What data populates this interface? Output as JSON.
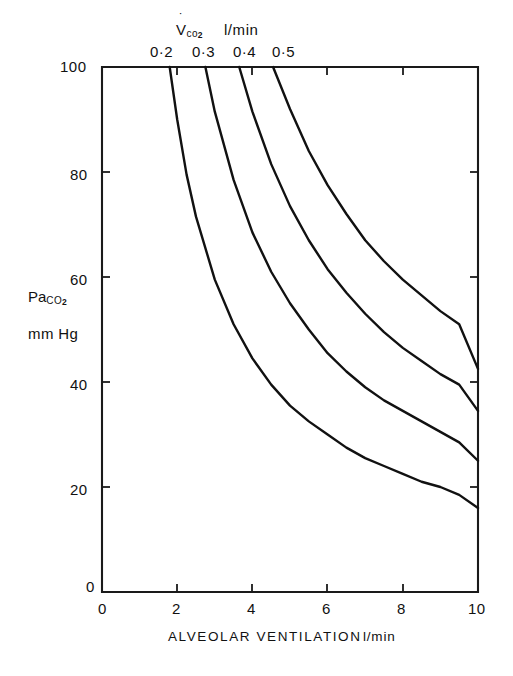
{
  "figure": {
    "background": "#ffffff",
    "line_color": "#111111",
    "axis_color": "#1a1a1a"
  },
  "top_axis": {
    "series_symbol": "V",
    "series_sub": "co",
    "series_sub2": "2",
    "series_units": "l/min",
    "tick_labels": [
      "0·2",
      "0·3",
      "0·4",
      "0·5"
    ]
  },
  "y_axis": {
    "label_line1_main": "Pa",
    "label_line1_sub": "CO",
    "label_line1_sub2": "2",
    "label_line2": "mm Hg",
    "tick_labels": [
      "0",
      "20",
      "40",
      "60",
      "80",
      "100"
    ]
  },
  "x_axis": {
    "title": "ALVEOLAR  VENTILATION",
    "units": "l/min",
    "tick_labels": [
      "0",
      "2",
      "4",
      "6",
      "8",
      "10"
    ]
  },
  "chart_data": {
    "type": "line",
    "title": "",
    "xlabel": "ALVEOLAR VENTILATION l/min",
    "ylabel": "PaCO2 mm Hg",
    "xlim": [
      0,
      10
    ],
    "ylim": [
      0,
      100
    ],
    "grid": false,
    "legend_position": "top-axis-labels",
    "relation": "PaCO2 = K * VCO2 / VA",
    "x_ticks": [
      0,
      2,
      4,
      6,
      8,
      10
    ],
    "y_ticks": [
      0,
      20,
      40,
      60,
      80,
      100
    ],
    "top_axis_label_values": [
      0.2,
      0.3,
      0.4,
      0.5
    ],
    "top_axis_label_positions_x": [
      1.8,
      2.75,
      3.65,
      4.55
    ],
    "series": [
      {
        "name": "VCO2 = 0.2 l/min",
        "K": 172,
        "x_start": 1.8,
        "y_at_x10": 16,
        "x": [
          1.8,
          2.0,
          2.25,
          2.5,
          3.0,
          3.5,
          4.0,
          4.5,
          5.0,
          5.5,
          6.0,
          6.5,
          7.0,
          7.5,
          8.0,
          8.5,
          9.0,
          9.5,
          10.0
        ],
        "values": [
          100,
          90,
          79.5,
          71.5,
          59.5,
          51,
          44.5,
          39.5,
          35.5,
          32.5,
          30,
          27.5,
          25.5,
          24,
          22.5,
          21,
          20,
          18.5,
          16
        ]
      },
      {
        "name": "VCO2 = 0.3 l/min",
        "K": 262,
        "x_start": 2.75,
        "y_at_x10": 25,
        "x": [
          2.75,
          3.0,
          3.5,
          4.0,
          4.5,
          5.0,
          5.5,
          6.0,
          6.5,
          7.0,
          7.5,
          8.0,
          8.5,
          9.0,
          9.5,
          10.0
        ],
        "values": [
          100,
          91.5,
          78.5,
          68.5,
          61,
          55,
          50,
          45.5,
          42,
          39,
          36.5,
          34.5,
          32.5,
          30.5,
          28.5,
          25
        ]
      },
      {
        "name": "VCO2 = 0.4 l/min",
        "K": 352,
        "x_start": 3.65,
        "y_at_x10": 34.5,
        "x": [
          3.65,
          4.0,
          4.5,
          5.0,
          5.5,
          6.0,
          6.5,
          7.0,
          7.5,
          8.0,
          8.5,
          9.0,
          9.5,
          10.0
        ],
        "values": [
          100,
          91.5,
          81.5,
          73.5,
          67,
          61.5,
          57,
          53,
          49.5,
          46.5,
          44,
          41.5,
          39.5,
          34.5
        ]
      },
      {
        "name": "VCO2 = 0.5 l/min",
        "K": 440,
        "x_start": 4.55,
        "y_at_x10": 42.5,
        "x": [
          4.55,
          5.0,
          5.5,
          6.0,
          6.5,
          7.0,
          7.5,
          8.0,
          8.5,
          9.0,
          9.5,
          10.0
        ],
        "values": [
          100,
          92,
          84,
          77.5,
          72,
          67,
          63,
          59.5,
          56.5,
          53.5,
          51,
          42.5
        ]
      }
    ]
  },
  "plot_geometry": {
    "left": 102,
    "right": 478,
    "top": 67,
    "bottom": 592
  }
}
